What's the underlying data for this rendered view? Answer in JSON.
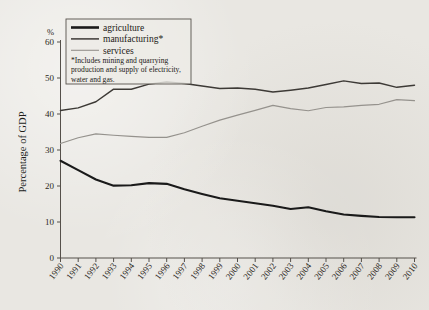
{
  "chart_data": {
    "type": "line",
    "title": "",
    "xlabel": "",
    "ylabel": "Percentage of GDP",
    "y_unit": "%",
    "ylim": [
      0,
      60
    ],
    "yticks": [
      0,
      10,
      20,
      30,
      40,
      50,
      60
    ],
    "grid": false,
    "legend_position": "top-left",
    "x": [
      1990,
      1991,
      1992,
      1993,
      1994,
      1995,
      1996,
      1997,
      1998,
      1999,
      2000,
      2001,
      2002,
      2003,
      2004,
      2005,
      2006,
      2007,
      2008,
      2009,
      2010
    ],
    "categories": [
      "1990",
      "1991",
      "1992",
      "1993",
      "1994",
      "1995",
      "1996",
      "1997",
      "1998",
      "1999",
      "2000",
      "2001",
      "2002",
      "2003",
      "2004",
      "2005",
      "2006",
      "2007",
      "2008",
      "2009",
      "2010"
    ],
    "series": [
      {
        "name": "agriculture",
        "color": "#1a1a1a",
        "width": 2.1,
        "values": [
          27.0,
          24.4,
          21.8,
          20.1,
          20.2,
          20.8,
          20.6,
          19.1,
          17.8,
          16.6,
          15.9,
          15.2,
          14.5,
          13.6,
          14.1,
          13.0,
          12.1,
          11.7,
          11.4,
          11.3,
          11.3
        ]
      },
      {
        "name": "manufacturing*",
        "color": "#3d3a36",
        "width": 1.5,
        "values": [
          41.0,
          41.7,
          43.4,
          46.9,
          46.9,
          48.3,
          48.9,
          48.5,
          47.8,
          47.1,
          47.2,
          46.9,
          46.1,
          46.6,
          47.2,
          48.2,
          49.2,
          48.5,
          48.6,
          47.4,
          48.0
        ]
      },
      {
        "name": "services",
        "color": "#95928d",
        "width": 1.2,
        "values": [
          31.8,
          33.4,
          34.5,
          34.1,
          33.8,
          33.5,
          33.5,
          34.8,
          36.6,
          38.3,
          39.7,
          41.0,
          42.4,
          41.5,
          40.9,
          41.8,
          42.0,
          42.4,
          42.7,
          44.0,
          43.7
        ]
      }
    ],
    "legend": [
      {
        "label": "agriculture",
        "color": "#1a1a1a",
        "width": 2.6
      },
      {
        "label": "manufacturing*",
        "color": "#3d3a36",
        "width": 1.5
      },
      {
        "label": "services",
        "color": "#95928d",
        "width": 1.1
      }
    ],
    "footnote_lines": [
      "*Includes mining and quarrying",
      "production and supply of electricity,",
      "water and gas."
    ]
  },
  "colors": {
    "background": "#e9e7e2",
    "axis": "#55504a",
    "text": "#1c1916"
  }
}
